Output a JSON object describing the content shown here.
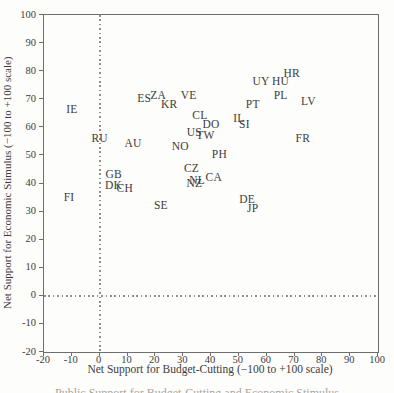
{
  "figure": {
    "caption_partial": "Public Support for Budget-Cutting and Economic Stimulus"
  },
  "colors": {
    "background": "#fdfdfb",
    "axis_frame": "#6e6e6e",
    "text": "#3c3c3c",
    "dotted_reference_line": "#8f8f8f",
    "caption_faint": "#aaa49b"
  },
  "chart_data": {
    "type": "scatter",
    "title": "",
    "xlabel": "Net Support for Budget-Cutting (−100 to +100 scale)",
    "ylabel": "Net Support for Economic Stimulus (−100 to +100 scale)",
    "xlim": [
      -20,
      100
    ],
    "ylim": [
      -20,
      100
    ],
    "x_ticks": [
      -20,
      -10,
      0,
      10,
      20,
      30,
      40,
      50,
      60,
      70,
      80,
      90,
      100
    ],
    "y_ticks": [
      -20,
      -10,
      0,
      10,
      20,
      30,
      40,
      50,
      60,
      70,
      80,
      90,
      100
    ],
    "grid": false,
    "legend": "none",
    "marker_style": "country-code-text-labels",
    "reference_lines": [
      {
        "axis": "x",
        "value": 0,
        "style": "dotted"
      },
      {
        "axis": "y",
        "value": 0,
        "style": "dotted"
      }
    ],
    "points": [
      {
        "label": "IE",
        "x": -10,
        "y": 66
      },
      {
        "label": "FI",
        "x": -11,
        "y": 35
      },
      {
        "label": "RU",
        "x": 0,
        "y": 56
      },
      {
        "label": "GB",
        "x": 5,
        "y": 43
      },
      {
        "label": "DK",
        "x": 5,
        "y": 39
      },
      {
        "label": "CH",
        "x": 9,
        "y": 38
      },
      {
        "label": "AU",
        "x": 12,
        "y": 54
      },
      {
        "label": "ES",
        "x": 16,
        "y": 70
      },
      {
        "label": "ZA",
        "x": 21,
        "y": 71
      },
      {
        "label": "SE",
        "x": 22,
        "y": 32
      },
      {
        "label": "KR",
        "x": 25,
        "y": 68
      },
      {
        "label": "NO",
        "x": 29,
        "y": 53
      },
      {
        "label": "VE",
        "x": 32,
        "y": 71
      },
      {
        "label": "CZ",
        "x": 33,
        "y": 45
      },
      {
        "label": "US",
        "x": 34,
        "y": 58
      },
      {
        "label": "NZ",
        "x": 34,
        "y": 40
      },
      {
        "label": "NL",
        "x": 35,
        "y": 41
      },
      {
        "label": "CL",
        "x": 36,
        "y": 64
      },
      {
        "label": "TW",
        "x": 38,
        "y": 57
      },
      {
        "label": "DO",
        "x": 40,
        "y": 61
      },
      {
        "label": "CA",
        "x": 41,
        "y": 42
      },
      {
        "label": "PH",
        "x": 43,
        "y": 50
      },
      {
        "label": "IL",
        "x": 50,
        "y": 63
      },
      {
        "label": "SI",
        "x": 52,
        "y": 61
      },
      {
        "label": "DE",
        "x": 53,
        "y": 34
      },
      {
        "label": "PT",
        "x": 55,
        "y": 68
      },
      {
        "label": "JP",
        "x": 55,
        "y": 31
      },
      {
        "label": "UY",
        "x": 58,
        "y": 76
      },
      {
        "label": "HU",
        "x": 65,
        "y": 76
      },
      {
        "label": "PL",
        "x": 65,
        "y": 71
      },
      {
        "label": "HR",
        "x": 69,
        "y": 79
      },
      {
        "label": "FR",
        "x": 73,
        "y": 56
      },
      {
        "label": "LV",
        "x": 75,
        "y": 69
      }
    ]
  }
}
